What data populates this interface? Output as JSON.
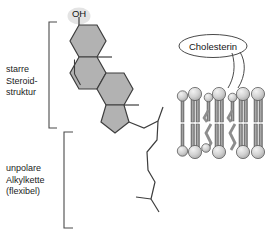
{
  "figure": {
    "title_text": "Cholesterin Struktur und Membran",
    "background_color": "#ffffff",
    "line_color": "#3a3a3a",
    "ring_fill": "#b0b0b0",
    "head_fill": "#c9c9c9",
    "tail_fill": "#8a8a8a"
  },
  "labels": {
    "steroid": "starre\nSteroid-\nstruktur",
    "alkyl": "unpolare\nAlkylkette\n(flexibel)"
  },
  "molecule": {
    "hydroxyl_label": "OH",
    "highlight_color": "#e2e2e2",
    "rings": [
      {
        "name": "ring-a",
        "type": "six-membered"
      },
      {
        "name": "ring-b",
        "type": "six-membered"
      },
      {
        "name": "ring-c",
        "type": "six-membered"
      },
      {
        "name": "ring-d",
        "type": "five-membered"
      }
    ],
    "methyl_count": 2,
    "double_bond": "C5-C6"
  },
  "membrane": {
    "callout_text": "Cholesterin",
    "leaflets": 2,
    "phospholipids_per_leaflet": 5,
    "cholesterol_molecules": 2
  }
}
